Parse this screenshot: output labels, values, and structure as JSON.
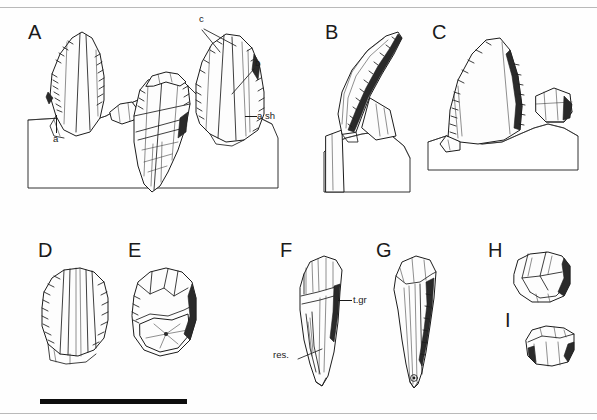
{
  "figure": {
    "type": "scientific-illustration-plate",
    "background_color": "#fefefe",
    "ink_color": "#1c1c1c"
  },
  "panels": [
    {
      "id": "A",
      "label": "A",
      "x": 28,
      "y": 22,
      "description": "three teeth in matrix, crowns with carinae and denticles"
    },
    {
      "id": "B",
      "label": "B",
      "x": 325,
      "y": 22,
      "description": "recurved tooth in matrix, serrated distal carina"
    },
    {
      "id": "C",
      "label": "C",
      "x": 432,
      "y": 22,
      "description": "triangular crown in matrix with small adjacent fragment"
    },
    {
      "id": "D",
      "label": "D",
      "x": 38,
      "y": 240,
      "description": "broad crown, labial view with vertical ridges"
    },
    {
      "id": "E",
      "label": "E",
      "x": 128,
      "y": 240,
      "description": "worn crown, basal view showing pulp cavity"
    },
    {
      "id": "F",
      "label": "F",
      "x": 280,
      "y": 240,
      "description": "tooth with root, lingual view"
    },
    {
      "id": "G",
      "label": "G",
      "x": 376,
      "y": 240,
      "description": "tooth with elongate root, labial view"
    },
    {
      "id": "H",
      "label": "H",
      "x": 488,
      "y": 240,
      "description": "small crown fragment, occlusal view"
    },
    {
      "id": "I",
      "label": "I",
      "x": 505,
      "y": 310,
      "description": "small worn crown, lateral view"
    }
  ],
  "annotations": [
    {
      "id": "a",
      "text": "a",
      "panel": "A",
      "x": 53,
      "y": 134,
      "leader": "vertical"
    },
    {
      "id": "b",
      "text": "b",
      "panel": "A",
      "x": 255,
      "y": 62,
      "leader": "diagonal"
    },
    {
      "id": "c",
      "text": "c",
      "panel": "A",
      "x": 199,
      "y": 18,
      "leader": "double-diagonal"
    },
    {
      "id": "ash",
      "text": "a sh",
      "panel": "A",
      "x": 256,
      "y": 110,
      "leader": "horizontal"
    },
    {
      "id": "tgr",
      "text": "t.gr",
      "panel": "F",
      "x": 352,
      "y": 295,
      "leader": "horizontal"
    },
    {
      "id": "res",
      "text": "res.",
      "panel": "F",
      "x": 277,
      "y": 354,
      "leader": "diagonal"
    }
  ],
  "scale_bar": {
    "name": "scale-bar",
    "x": 40,
    "y": 399,
    "width": 147,
    "height": 5,
    "color": "#0d0d0d",
    "caption": ""
  },
  "rules": {
    "top_y": 7,
    "bottom_y": 413,
    "color": "#b9b9b9"
  }
}
